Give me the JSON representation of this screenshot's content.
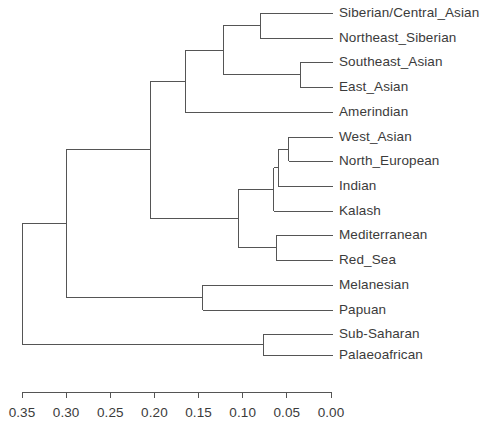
{
  "figure": {
    "type": "dendrogram",
    "orientation": "horizontal-right-to-left",
    "line_color": "#555555",
    "text_color": "#3b3b3b",
    "background": "#ffffff"
  },
  "axis": {
    "label": "",
    "min": 0.0,
    "max": 0.35,
    "tick_labels": [
      "0.35",
      "0.30",
      "0.25",
      "0.20",
      "0.15",
      "0.10",
      "0.05",
      "0.00"
    ],
    "tick_values": [
      0.35,
      0.3,
      0.25,
      0.2,
      0.15,
      0.1,
      0.05,
      0.0
    ],
    "pixel_left": 22,
    "pixel_right": 331,
    "pixel_y": 392
  },
  "chart_data": {
    "type": "dendrogram",
    "title": "",
    "xlabel": "",
    "ylabel": "",
    "xlim": [
      0.35,
      0.0
    ],
    "grid": false,
    "legend": "none",
    "leaves": [
      {
        "label": "Siberian/Central_Asian",
        "y": 13
      },
      {
        "label": "Northeast_Siberian",
        "y": 38
      },
      {
        "label": "Southeast_Asian",
        "y": 62
      },
      {
        "label": "East_Asian",
        "y": 87
      },
      {
        "label": "Amerindian",
        "y": 112
      },
      {
        "label": "West_Asian",
        "y": 137
      },
      {
        "label": "North_European",
        "y": 161
      },
      {
        "label": "Indian",
        "y": 186
      },
      {
        "label": "Kalash",
        "y": 211
      },
      {
        "label": "Mediterranean",
        "y": 235
      },
      {
        "label": "Red_Sea",
        "y": 260
      },
      {
        "label": "Melanesian",
        "y": 285
      },
      {
        "label": "Papuan",
        "y": 310
      },
      {
        "label": "Sub-Saharan",
        "y": 334
      },
      {
        "label": "Palaeoafrican",
        "y": 355
      }
    ],
    "merges": [
      {
        "id": "m1",
        "name": "Siberian/Central_Asian + Northeast_Siberian",
        "height": 0.08,
        "children": [
          "Siberian/Central_Asian",
          "Northeast_Siberian"
        ]
      },
      {
        "id": "m2",
        "name": "Southeast_Asian + East_Asian",
        "height": 0.035,
        "children": [
          "Southeast_Asian",
          "East_Asian"
        ]
      },
      {
        "id": "m3",
        "name": "North-Asian + East-Asian cluster",
        "height": 0.122,
        "children": [
          "m1",
          "m2"
        ]
      },
      {
        "id": "m4",
        "name": "Asian cluster + Amerindian",
        "height": 0.165,
        "children": [
          "m3",
          "Amerindian"
        ]
      },
      {
        "id": "m5",
        "name": "West_Asian + North_European",
        "height": 0.048,
        "children": [
          "West_Asian",
          "North_European"
        ]
      },
      {
        "id": "m6",
        "name": "West-Eurasian core + Indian",
        "height": 0.06,
        "children": [
          "m5",
          "Indian"
        ]
      },
      {
        "id": "m7",
        "name": "West-Eurasian + Kalash",
        "height": 0.065,
        "children": [
          "m6",
          "Kalash"
        ]
      },
      {
        "id": "m8",
        "name": "Mediterranean + Red_Sea",
        "height": 0.062,
        "children": [
          "Mediterranean",
          "Red_Sea"
        ]
      },
      {
        "id": "m9",
        "name": "West-Eurasian cluster",
        "height": 0.105,
        "children": [
          "m7",
          "m8"
        ]
      },
      {
        "id": "m10",
        "name": "Eurasian cluster",
        "height": 0.205,
        "children": [
          "m4",
          "m9"
        ]
      },
      {
        "id": "m11",
        "name": "Melanesian + Papuan",
        "height": 0.145,
        "children": [
          "Melanesian",
          "Papuan"
        ]
      },
      {
        "id": "m12",
        "name": "Eurasian + Oceanian",
        "height": 0.3,
        "children": [
          "m10",
          "m11"
        ]
      },
      {
        "id": "m13",
        "name": "Sub-Saharan + Palaeoafrican",
        "height": 0.077,
        "children": [
          "Sub-Saharan",
          "Palaeoafrican"
        ]
      },
      {
        "id": "m14",
        "name": "Root: African + non-African",
        "height": 0.35,
        "children": [
          "m12",
          "m13"
        ]
      }
    ]
  }
}
